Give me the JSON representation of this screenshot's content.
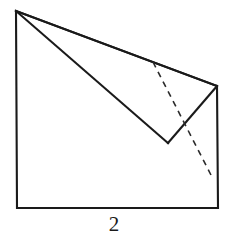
{
  "figure": {
    "kind": "origami-fold-step-diagram",
    "caption": "2",
    "background_color": "#ffffff",
    "stroke_color": "#1a1a1a",
    "fold_line_color": "#2b2b2b",
    "fill_color": "#ffffff",
    "solid_stroke_width": 2.1,
    "dashed_stroke_width": 1.6,
    "dash_pattern": "6,5"
  },
  "geometry": {
    "canvas": {
      "width": 228,
      "height": 239
    },
    "points": {
      "top_left_apex": {
        "x": 16,
        "y": 11
      },
      "bottom_left": {
        "x": 17,
        "y": 208
      },
      "bottom_right": {
        "x": 218,
        "y": 208
      },
      "right_vertex": {
        "x": 217,
        "y": 86
      },
      "notch_bottom": {
        "x": 168,
        "y": 143
      },
      "dashed_start": {
        "x": 153,
        "y": 62
      },
      "dashed_end": {
        "x": 212,
        "y": 177
      }
    },
    "outline_path": "M16,11 L17,208 L218,208 L217,86 Z",
    "flap_upper_edge": "M16,11 L217,86",
    "flap_lower_edge": "M16,11 L168,143",
    "notch_right_edge": "M168,143 L217,86",
    "fold_line": "M153,62 L212,177"
  },
  "labels": {
    "caption_text": "2",
    "caption_role": "step-number"
  }
}
